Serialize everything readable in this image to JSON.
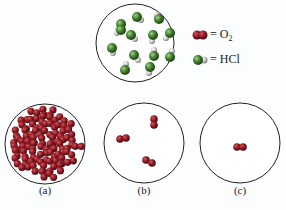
{
  "legend": {
    "o2": {
      "equals": "= O",
      "subscript": "2",
      "color": "#8b1a22"
    },
    "hcl": {
      "equals": "= HCl",
      "cl_color": "#3f7a2a",
      "h_color": "#c8c8c8"
    }
  },
  "panels": [
    {
      "label": "(a)",
      "description": "container densely packed with O2 molecules"
    },
    {
      "label": "(b)",
      "description": "container with 3 O2 molecules"
    },
    {
      "label": "(c)",
      "description": "container with 1 O2 molecule"
    }
  ],
  "top_panel": {
    "description": "container with 13 HCl molecules"
  }
}
